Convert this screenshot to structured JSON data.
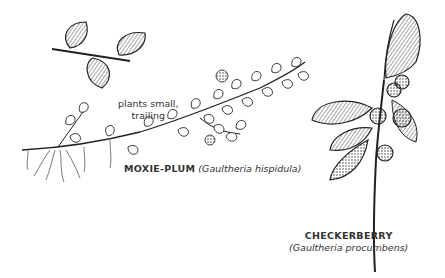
{
  "illustration": {
    "background": "#ffffff",
    "ink_color": "#1a1a1a",
    "annotations": {
      "habit_note_line1": "plants small,",
      "habit_note_line2": "trailing"
    },
    "species": [
      {
        "common_name": "MOXIE-PLUM",
        "scientific_name": "(Gaultheria hispidula)"
      },
      {
        "common_name": "CHECKERBERRY",
        "scientific_name": "(Gaultheria procumbens)"
      }
    ],
    "drawings": [
      "moxie-plum-leaf-detail",
      "moxie-plum-trailing-stem",
      "checkerberry-sprig-with-berries"
    ]
  }
}
